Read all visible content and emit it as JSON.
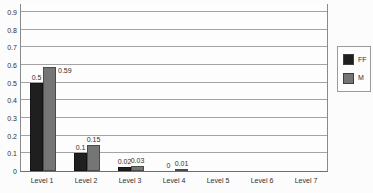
{
  "chart_data": {
    "type": "bar",
    "title": "",
    "xlabel": "",
    "ylabel": "",
    "categories": [
      "Level 1",
      "Level 2",
      "Level 3",
      "Level 4",
      "Level 5",
      "Level 6",
      "Level 7"
    ],
    "series": [
      {
        "name": "FF",
        "color": "#1f1f1f",
        "values": [
          0.5,
          0.1,
          0.02,
          0,
          0,
          0,
          0
        ],
        "data_labels": [
          "0.5",
          "0.1",
          "0.02",
          "0",
          "",
          "",
          ""
        ],
        "label_placement": [
          "top",
          "top",
          "top",
          "top",
          "",
          "",
          ""
        ]
      },
      {
        "name": "M",
        "color": "#757575",
        "values": [
          0.59,
          0.15,
          0.03,
          0.01,
          0,
          0,
          0
        ],
        "data_labels": [
          "0.59",
          "0.15",
          "0.03",
          "0.01",
          "",
          "",
          ""
        ],
        "label_placement": [
          "right",
          "top",
          "top",
          "top",
          "",
          "",
          ""
        ]
      }
    ],
    "y_axis": {
      "tick_labels": [
        "0",
        "0.1",
        "0.2",
        "0.3",
        "0.4",
        "0.5",
        "0.6",
        "0.7",
        "0.8",
        "0.9"
      ],
      "tick_values": [
        0,
        0.1,
        0.2,
        0.3,
        0.4,
        0.5,
        0.6,
        0.7,
        0.8,
        0.9
      ]
    },
    "ylim": [
      0,
      0.95
    ],
    "grid": true,
    "legend": {
      "entries": [
        "FF",
        "M"
      ],
      "position": "right-outside"
    }
  },
  "colors": {
    "ff": "#1f1f1f",
    "m": "#757575",
    "gridline": "#a3a3a3",
    "axis": "#8a8a8a",
    "text": "#2f2f2f",
    "background": "#fcfcfc",
    "legend_border": "#9a9a9a"
  }
}
